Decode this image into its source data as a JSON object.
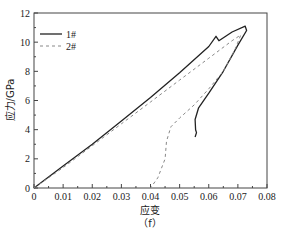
{
  "chart_data": {
    "type": "line",
    "title": "",
    "caption": "（f）",
    "xlabel": "应变",
    "ylabel": "应力/GPa",
    "xlim": [
      0,
      0.08
    ],
    "ylim": [
      0,
      12
    ],
    "xticks": [
      "0",
      "0.01",
      "0.02",
      "0.03",
      "0.04",
      "0.05",
      "0.06",
      "0.07",
      "0.08"
    ],
    "yticks": [
      "0",
      "2",
      "4",
      "6",
      "8",
      "10",
      "12"
    ],
    "grid": false,
    "legend_position": "upper left",
    "series": [
      {
        "name": "1#",
        "style": "solid",
        "color": "#222222",
        "points": [
          [
            0,
            0
          ],
          [
            0.01,
            1.5
          ],
          [
            0.02,
            3.0
          ],
          [
            0.03,
            4.6
          ],
          [
            0.04,
            6.2
          ],
          [
            0.05,
            7.9
          ],
          [
            0.06,
            9.7
          ],
          [
            0.0625,
            10.4
          ],
          [
            0.0635,
            10.1
          ],
          [
            0.068,
            10.7
          ],
          [
            0.0725,
            11.1
          ],
          [
            0.073,
            10.8
          ],
          [
            0.07,
            9.8
          ],
          [
            0.065,
            8.0
          ],
          [
            0.06,
            6.5
          ],
          [
            0.0565,
            5.5
          ],
          [
            0.0553,
            4.7
          ],
          [
            0.0555,
            4.0
          ],
          [
            0.0558,
            3.8
          ],
          [
            0.0553,
            3.5
          ]
        ]
      },
      {
        "name": "2#",
        "style": "dashed",
        "color": "#888888",
        "points": [
          [
            0,
            0
          ],
          [
            0.01,
            1.4
          ],
          [
            0.02,
            2.9
          ],
          [
            0.03,
            4.4
          ],
          [
            0.04,
            5.9
          ],
          [
            0.05,
            7.4
          ],
          [
            0.06,
            8.9
          ],
          [
            0.068,
            10.1
          ],
          [
            0.071,
            10.5
          ],
          [
            0.069,
            9.5
          ],
          [
            0.065,
            8.0
          ],
          [
            0.06,
            6.8
          ],
          [
            0.055,
            5.7
          ],
          [
            0.05,
            4.8
          ],
          [
            0.047,
            4.2
          ],
          [
            0.0455,
            3.2
          ],
          [
            0.045,
            2.0
          ],
          [
            0.0425,
            0.7
          ],
          [
            0.04,
            0
          ]
        ]
      }
    ]
  }
}
